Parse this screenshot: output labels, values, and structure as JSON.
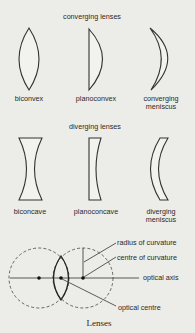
{
  "sections": {
    "converging": {
      "title": "converging lenses",
      "lenses": [
        {
          "name": "biconvex",
          "label_lines": [
            "biconvex"
          ]
        },
        {
          "name": "planoconvex",
          "label_lines": [
            "planoconvex"
          ]
        },
        {
          "name": "converging-meniscus",
          "label_lines": [
            "converging",
            "meniscus"
          ]
        }
      ]
    },
    "diverging": {
      "title": "diverging lenses",
      "lenses": [
        {
          "name": "biconcave",
          "label_lines": [
            "biconcave"
          ]
        },
        {
          "name": "planoconcave",
          "label_lines": [
            "planoconcave"
          ]
        },
        {
          "name": "diverging-meniscus",
          "label_lines": [
            "diverging",
            "meniscus"
          ]
        }
      ]
    }
  },
  "geometry_diagram": {
    "labels": {
      "radius": "radius of curvature",
      "centre": "centre of curvature",
      "axis": "optical axis",
      "optical_centre": "optical centre"
    }
  },
  "caption": "Lenses"
}
